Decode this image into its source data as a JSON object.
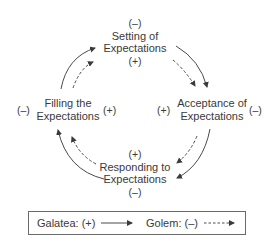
{
  "diagram": {
    "type": "cycle",
    "nodes": {
      "top": {
        "label_line1": "Setting of",
        "label_line2": "Expectations",
        "sign_above": "(–)",
        "sign_below": "(+)"
      },
      "right": {
        "label_line1": "Acceptance of",
        "label_line2": "Expectations",
        "sign_left": "(+)",
        "sign_right": "(–)"
      },
      "bottom": {
        "label_line1": "Responding to",
        "label_line2": "Expectations",
        "sign_above": "(+)",
        "sign_below": "(–)"
      },
      "left": {
        "label_line1": "Filling the",
        "label_line2": "Expectations",
        "sign_left": "(–)",
        "sign_right": "(+)"
      }
    },
    "flow_order": [
      "Setting of Expectations",
      "Acceptance of Expectations",
      "Responding to Expectations",
      "Filling the Expectations"
    ],
    "colors": {
      "text": "#3a3a3a",
      "arrow": "#4a4a4a",
      "border": "#6a6a6a"
    }
  },
  "legend": {
    "galatea_label": "Galatea: (+)",
    "galatea_line": "solid",
    "golem_label": "Golem: (–)",
    "golem_line": "dashed"
  }
}
